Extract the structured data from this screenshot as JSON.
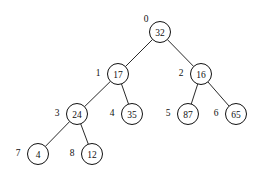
{
  "diagram": {
    "type": "binary-tree",
    "canvas": {
      "width": 265,
      "height": 178
    },
    "background_color": "#ffffff",
    "stroke_color": "#111111",
    "node_fill_color": "#ffffff",
    "node_radius": 10.5,
    "index_label_offset": {
      "dx": -20,
      "dy": -1
    },
    "root_index_label_offset": {
      "dx": -14,
      "dy": -13
    }
  },
  "chart_data": {
    "type": "diagram",
    "nodes": [
      {
        "index": "0",
        "value": "32",
        "x": 160,
        "y": 32,
        "label_x": 146,
        "label_y": 19,
        "parent": null,
        "side": "root"
      },
      {
        "index": "1",
        "value": "17",
        "x": 118,
        "y": 74,
        "label_x": 98,
        "label_y": 73,
        "parent": "0",
        "side": "left"
      },
      {
        "index": "2",
        "value": "16",
        "x": 201,
        "y": 74,
        "label_x": 181,
        "label_y": 73,
        "parent": "0",
        "side": "right"
      },
      {
        "index": "3",
        "value": "24",
        "x": 77,
        "y": 114,
        "label_x": 57,
        "label_y": 113,
        "parent": "1",
        "side": "left"
      },
      {
        "index": "4",
        "value": "35",
        "x": 132,
        "y": 114,
        "label_x": 112,
        "label_y": 113,
        "parent": "1",
        "side": "right"
      },
      {
        "index": "5",
        "value": "87",
        "x": 188,
        "y": 114,
        "label_x": 168,
        "label_y": 113,
        "parent": "2",
        "side": "left"
      },
      {
        "index": "6",
        "value": "65",
        "x": 236,
        "y": 114,
        "label_x": 216,
        "label_y": 113,
        "parent": "2",
        "side": "right"
      },
      {
        "index": "7",
        "value": "4",
        "x": 38,
        "y": 154,
        "label_x": 18,
        "label_y": 153,
        "parent": "3",
        "side": "left"
      },
      {
        "index": "8",
        "value": "12",
        "x": 92,
        "y": 154,
        "label_x": 72,
        "label_y": 153,
        "parent": "3",
        "side": "right"
      }
    ],
    "edges": [
      {
        "from": "0",
        "to": "1"
      },
      {
        "from": "0",
        "to": "2"
      },
      {
        "from": "1",
        "to": "3"
      },
      {
        "from": "1",
        "to": "4"
      },
      {
        "from": "2",
        "to": "5"
      },
      {
        "from": "2",
        "to": "6"
      },
      {
        "from": "3",
        "to": "7"
      },
      {
        "from": "3",
        "to": "8"
      }
    ],
    "array_order": [
      "32",
      "17",
      "16",
      "24",
      "35",
      "87",
      "65",
      "4",
      "12"
    ],
    "index_order": [
      "0",
      "1",
      "2",
      "3",
      "4",
      "5",
      "6",
      "7",
      "8"
    ]
  }
}
